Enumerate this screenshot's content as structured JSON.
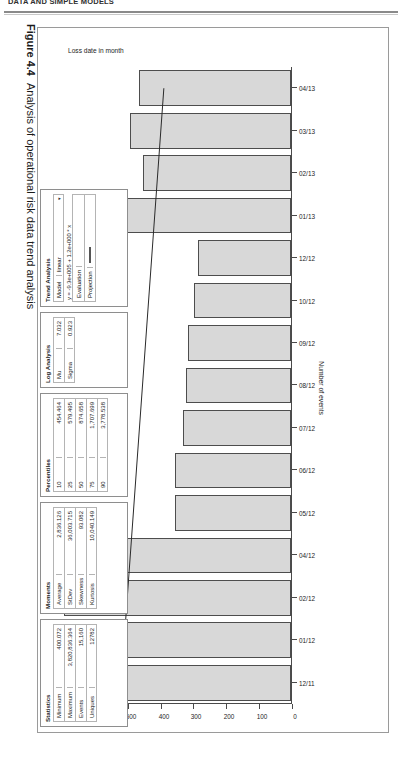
{
  "running_head": "DATA AND SIMPLE MODELS",
  "caption": {
    "figure_number": "Figure 4.4",
    "text": "Analysis of operational risk data trend analysis"
  },
  "chart_data": {
    "type": "bar",
    "title": "",
    "orientation": "horizontal-rotated",
    "xlabel": "Loss date in month",
    "ylabel": "Number of events",
    "categories": [
      "12/11",
      "01/12",
      "02/12",
      "04/12",
      "05/12",
      "06/12",
      "07/12",
      "08/12",
      "09/12",
      "10/12",
      "12/12",
      "01/13",
      "02/13",
      "03/13",
      "04/13"
    ],
    "values": [
      622,
      610,
      690,
      594,
      352,
      352,
      330,
      320,
      315,
      295,
      283,
      500,
      452,
      490,
      462
    ],
    "ylim": [
      0,
      700
    ],
    "yticks": [
      0,
      100,
      200,
      300,
      400,
      500,
      600,
      700
    ],
    "grid": false,
    "legend": false,
    "trend_line": {
      "label": "linear trend",
      "start": {
        "x_index": 0,
        "y": 520
      },
      "end": {
        "x_index": 14,
        "y": 390
      }
    }
  },
  "panels": {
    "statistics": {
      "title": "Statistics",
      "rows": [
        {
          "key": "Minimum",
          "value": "400.072"
        },
        {
          "key": "Maximum",
          "value": "3,820,836.364"
        },
        {
          "key": "Events",
          "value": "15,160"
        },
        {
          "key": "Uniques",
          "value": "12782"
        }
      ]
    },
    "moments": {
      "title": "Moments",
      "rows": [
        {
          "key": "Average",
          "value": "2,836.126"
        },
        {
          "key": "StDev",
          "value": "36,003.715"
        },
        {
          "key": "Skewness",
          "value": "93.082"
        },
        {
          "key": "Kurtosis",
          "value": "10,040.149"
        }
      ]
    },
    "percentiles": {
      "title": "Percentiles",
      "rows": [
        {
          "key": "10",
          "value": "454.464"
        },
        {
          "key": "25",
          "value": "579.495"
        },
        {
          "key": "50",
          "value": "874.658"
        },
        {
          "key": "75",
          "value": "1,707.699"
        },
        {
          "key": "90",
          "value": "3,778.538"
        }
      ]
    },
    "log_analysis": {
      "title": "Log Analysis",
      "rows": [
        {
          "key": "Mu",
          "value": "7.032"
        },
        {
          "key": "Sigma",
          "value": "0.923"
        }
      ]
    },
    "trend_analysis": {
      "title": "Trend Analysis",
      "model_label": "Model",
      "model_value": "linear",
      "model_caret": "▾",
      "equation": "y = -9.3e+005 + 1.2e+000 * x",
      "checkboxes": [
        {
          "key": "Evaluation",
          "swatch": "blank"
        },
        {
          "key": "Projection",
          "swatch": "line"
        }
      ]
    }
  }
}
